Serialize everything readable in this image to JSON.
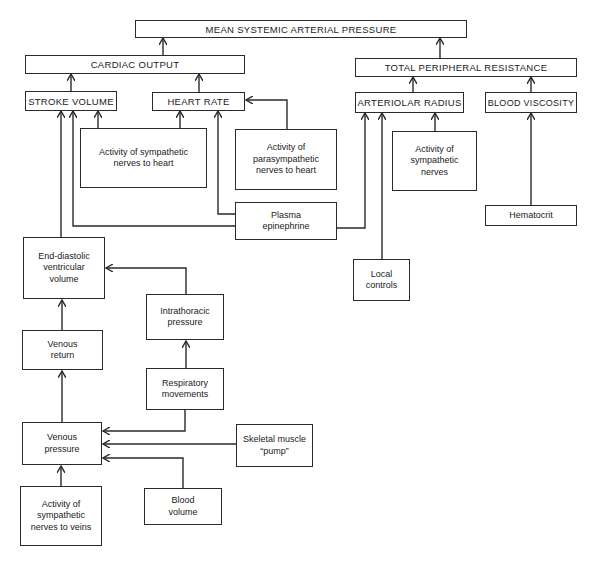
{
  "diagram": {
    "nodes": {
      "maap": {
        "label": "MEAN SYSTEMIC ARTERIAL PRESSURE"
      },
      "cardiac_output": {
        "label": "CARDIAC OUTPUT"
      },
      "tpr": {
        "label": "TOTAL PERIPHERAL RESISTANCE"
      },
      "stroke_volume": {
        "label": "STROKE VOLUME"
      },
      "heart_rate": {
        "label": "HEART RATE"
      },
      "arteriolar_radius": {
        "label": "ARTERIOLAR RADIUS"
      },
      "blood_viscosity": {
        "label": "BLOOD VISCOSITY"
      },
      "symp_heart": {
        "label": "Activity of sympathetic nerves to heart"
      },
      "parasymp_heart": {
        "label": "Activity of parasympathetic nerves to heart"
      },
      "symp_nerves": {
        "label": "Activity of sympathetic nerves"
      },
      "hematocrit": {
        "label": "Hematocrit"
      },
      "plasma_epinephrine": {
        "label": "Plasma epinephrine"
      },
      "local_controls": {
        "label": "Local controls"
      },
      "edv": {
        "label": "End-diastolic ventricular volume"
      },
      "intrathoracic": {
        "label": "Intrathoracic pressure"
      },
      "venous_return": {
        "label": "Venous return"
      },
      "respiratory": {
        "label": "Respiratory movements"
      },
      "venous_pressure": {
        "label": "Venous pressure"
      },
      "skeletal_pump": {
        "label": "Skeletal muscle “pump”"
      },
      "symp_veins": {
        "label": "Activity of sympathetic nerves to veins"
      },
      "blood_volume": {
        "label": "Blood volume"
      }
    },
    "edges": [
      [
        "cardiac_output",
        "maap"
      ],
      [
        "tpr",
        "maap"
      ],
      [
        "stroke_volume",
        "cardiac_output"
      ],
      [
        "heart_rate",
        "cardiac_output"
      ],
      [
        "arteriolar_radius",
        "tpr"
      ],
      [
        "blood_viscosity",
        "tpr"
      ],
      [
        "edv",
        "stroke_volume"
      ],
      [
        "plasma_epinephrine",
        "stroke_volume"
      ],
      [
        "symp_heart",
        "stroke_volume"
      ],
      [
        "symp_heart",
        "heart_rate"
      ],
      [
        "plasma_epinephrine",
        "heart_rate"
      ],
      [
        "parasymp_heart",
        "heart_rate"
      ],
      [
        "plasma_epinephrine",
        "arteriolar_radius"
      ],
      [
        "local_controls",
        "arteriolar_radius"
      ],
      [
        "symp_nerves",
        "arteriolar_radius"
      ],
      [
        "hematocrit",
        "blood_viscosity"
      ],
      [
        "intrathoracic",
        "edv"
      ],
      [
        "venous_return",
        "edv"
      ],
      [
        "respiratory",
        "intrathoracic"
      ],
      [
        "venous_pressure",
        "venous_return"
      ],
      [
        "respiratory",
        "venous_pressure"
      ],
      [
        "skeletal_pump",
        "venous_pressure"
      ],
      [
        "blood_volume",
        "venous_pressure"
      ],
      [
        "symp_veins",
        "venous_pressure"
      ]
    ],
    "colors": {
      "line": "#2a2a2a",
      "background": "#ffffff"
    }
  }
}
